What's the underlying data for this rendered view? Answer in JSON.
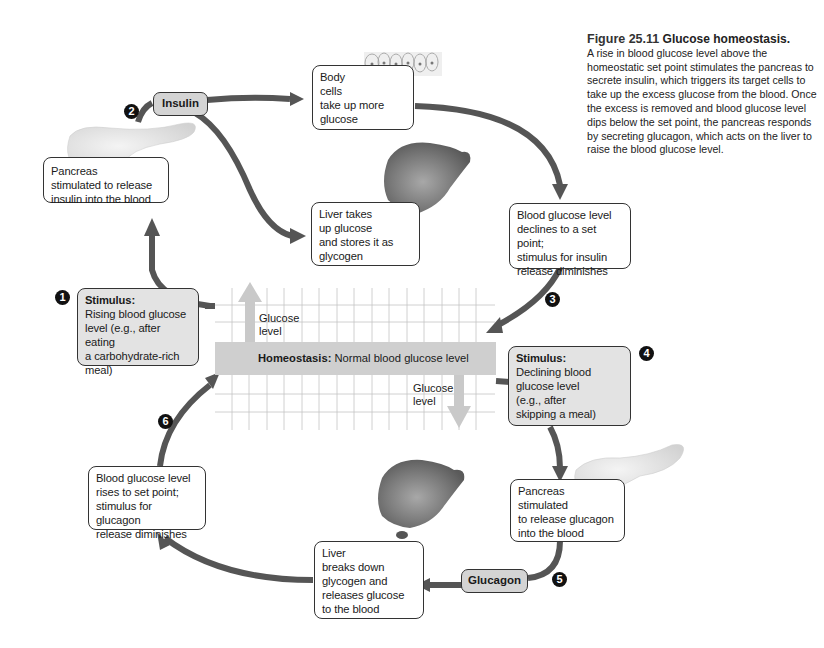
{
  "caption": {
    "figure_number": "Figure 25.11",
    "title": "Glucose homeostasis.",
    "body": "A rise in blood glucose level above the homeostatic set point stimulates the pancreas to secrete insulin, which triggers its target cells to take up the excess glucose from the blood. Once the excess is removed and blood glucose level dips below the set point, the pancreas responds by secreting glucagon, which acts on the liver to raise the blood glucose level."
  },
  "homeostasis": {
    "label_bold": "Homeostasis:",
    "label_rest": " Normal blood glucose level",
    "glucose_up_label_1": "Glucose",
    "glucose_up_label_2": "level",
    "glucose_down_label_1": "Glucose",
    "glucose_down_label_2": "level"
  },
  "steps": {
    "s1": {
      "number": "1",
      "title": "Stimulus:",
      "lines": [
        "Rising blood glucose",
        "level (e.g., after eating",
        "a carbohydrate-rich",
        "meal)"
      ]
    },
    "s2": {
      "number": "2",
      "hormone": "Insulin"
    },
    "s3": {
      "number": "3"
    },
    "s4": {
      "number": "4",
      "title": "Stimulus:",
      "lines": [
        "Declining blood",
        "glucose level",
        "(e.g., after",
        "skipping a meal)"
      ]
    },
    "s5": {
      "number": "5",
      "hormone": "Glucagon"
    },
    "s6": {
      "number": "6"
    }
  },
  "boxes": {
    "pancreas_insulin": [
      "Pancreas",
      "stimulated to release",
      "insulin into the blood"
    ],
    "body_cells": [
      "Body",
      "cells",
      "take up more",
      "glucose"
    ],
    "liver_takes": [
      "Liver takes",
      "up glucose",
      "and stores it as",
      "glycogen"
    ],
    "declines": [
      "Blood glucose level",
      "declines to a set point;",
      "stimulus for insulin",
      "release diminishes"
    ],
    "pancreas_glucagon": [
      "Pancreas",
      "stimulated",
      "to release glucagon",
      "into the blood"
    ],
    "liver_breaks": [
      "Liver",
      "breaks down",
      "glycogen and",
      "releases glucose",
      "to the blood"
    ],
    "rises": [
      "Blood glucose level",
      "rises to set point;",
      "stimulus for glucagon",
      "release diminishes"
    ]
  },
  "colors": {
    "arrow": "#555555",
    "light_arrow": "#c9c9c9",
    "homeostasis_bar": "#cfcfcf",
    "stimulus_box": "#e3e3e3",
    "hormone_tag": "#d4d4d4",
    "grid": "#bdbdbd"
  }
}
